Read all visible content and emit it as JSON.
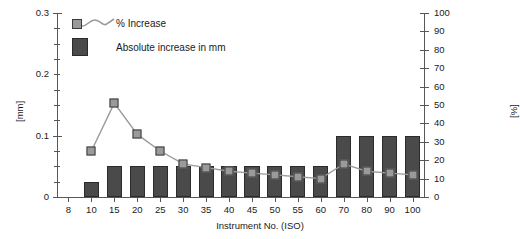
{
  "chart_data": {
    "type": "bar",
    "title": "",
    "xlabel": "Instrument No. (ISO)",
    "ylabel": "[mm]",
    "y2label": "[%]",
    "categories": [
      "8",
      "10",
      "15",
      "20",
      "25",
      "30",
      "35",
      "40",
      "45",
      "50",
      "55",
      "60",
      "70",
      "80",
      "90",
      "100"
    ],
    "ylim": [
      0,
      0.3
    ],
    "y2lim": [
      0,
      100
    ],
    "grid": false,
    "legend_position": "top-left",
    "y_ticks": [
      "0",
      "0.1",
      "0.2",
      "0.3"
    ],
    "y_tick_values": [
      0,
      0.1,
      0.2,
      0.3
    ],
    "y2_ticks": [
      "0",
      "10",
      "20",
      "30",
      "40",
      "50",
      "60",
      "70",
      "80",
      "90",
      "100"
    ],
    "y2_tick_values": [
      0,
      10,
      20,
      30,
      40,
      50,
      60,
      70,
      80,
      90,
      100
    ],
    "series": [
      {
        "name": "Absolute increase in mm",
        "kind": "bar",
        "axis": "left",
        "color": "#4a4a4a",
        "values": [
          0,
          0.025,
          0.05,
          0.05,
          0.05,
          0.05,
          0.05,
          0.05,
          0.05,
          0.05,
          0.05,
          0.05,
          0.1,
          0.1,
          0.1,
          0.1
        ]
      },
      {
        "name": "% Increase",
        "kind": "line",
        "axis": "right",
        "color": "#9a9a9a",
        "values": [
          null,
          25,
          51,
          34,
          25,
          18,
          16,
          14,
          13,
          12,
          11,
          10,
          18,
          14,
          13,
          12
        ]
      }
    ]
  },
  "legend": {
    "items": [
      {
        "label": "% Increase",
        "type": "line-marker"
      },
      {
        "label": "Absolute increase in mm",
        "type": "bar-swatch"
      }
    ]
  },
  "axes": {
    "left_title": "[mm]",
    "right_title": "[%]",
    "x_title": "Instrument No. (ISO)"
  }
}
